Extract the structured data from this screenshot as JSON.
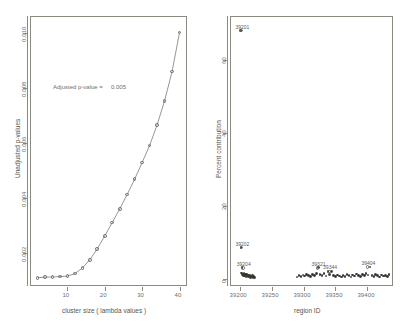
{
  "figure": {
    "panel_count": 2,
    "background": "#ffffff",
    "line_color": "#6a6a62",
    "marker_color": "#6a6a62",
    "point_color": "#2e2e2a"
  },
  "chart_data": [
    {
      "type": "line",
      "panel": "left",
      "title": "",
      "xlabel": "cluster size ( lambda values )",
      "ylabel": "Unadjusted p-values",
      "xlim": [
        0,
        42
      ],
      "ylim": [
        0.0008,
        0.0106
      ],
      "xticks": [
        10,
        20,
        30,
        40
      ],
      "xticklabels": [
        "10",
        "20",
        "30",
        "40"
      ],
      "yticks": [
        0.002,
        0.004,
        0.006,
        0.008,
        0.01
      ],
      "yticklabels": [
        "0.002",
        "0.004",
        "0.006",
        "0.008",
        "0.010"
      ],
      "grid": false,
      "legend": null,
      "marker": "open-circle",
      "annotations": [
        {
          "text": "Adjusted p-value =",
          "value": "0.005",
          "x": 13,
          "y": 0.0079
        }
      ],
      "x": [
        2,
        4,
        6,
        8,
        10,
        12,
        14,
        16,
        18,
        20,
        22,
        24,
        26,
        28,
        30,
        32,
        34,
        36,
        38,
        40
      ],
      "y": [
        0.0011,
        0.00112,
        0.00113,
        0.00114,
        0.00116,
        0.00125,
        0.00145,
        0.00175,
        0.00215,
        0.00262,
        0.0031,
        0.0036,
        0.00412,
        0.00468,
        0.00528,
        0.0059,
        0.00665,
        0.00752,
        0.00858,
        0.01
      ]
    },
    {
      "type": "scatter",
      "panel": "right",
      "title": "",
      "xlabel": "region ID",
      "ylabel": "Percent contribution",
      "xlim": [
        39185,
        39440
      ],
      "ylim": [
        -2,
        72
      ],
      "xticks": [
        39200,
        39250,
        39300,
        39350,
        39400
      ],
      "xticklabels": [
        "39200",
        "39250",
        "39300",
        "39350",
        "39400"
      ],
      "yticks": [
        0,
        20,
        40,
        60
      ],
      "yticklabels": [
        "0",
        "20",
        "40",
        "60"
      ],
      "grid": false,
      "legend": null,
      "marker": "filled-circle",
      "labeled_points": [
        {
          "label": "39201",
          "x": 39203,
          "y": 68.0
        },
        {
          "label": "39202",
          "x": 39203,
          "y": 8.5
        },
        {
          "label": "39204",
          "x": 39205,
          "y": 3.0
        },
        {
          "label": "39321",
          "x": 39322,
          "y": 3.0
        },
        {
          "label": "39344",
          "x": 39340,
          "y": 2.0
        },
        {
          "label": "39404",
          "x": 39400,
          "y": 3.2
        }
      ],
      "x": [
        39201,
        39202,
        39203,
        39204,
        39205,
        39206,
        39207,
        39208,
        39209,
        39210,
        39211,
        39212,
        39213,
        39214,
        39215,
        39216,
        39217,
        39218,
        39219,
        39220,
        39221,
        39222,
        39223,
        39290,
        39293,
        39296,
        39299,
        39302,
        39305,
        39308,
        39311,
        39314,
        39317,
        39320,
        39323,
        39326,
        39329,
        39332,
        39335,
        39338,
        39341,
        39344,
        39347,
        39350,
        39353,
        39356,
        39359,
        39362,
        39365,
        39368,
        39371,
        39374,
        39377,
        39380,
        39383,
        39386,
        39389,
        39392,
        39395,
        39398,
        39401,
        39404,
        39407,
        39410,
        39413,
        39416,
        39419,
        39422,
        39425,
        39428,
        39431,
        39434
      ],
      "y": [
        68.0,
        8.5,
        1.6,
        3.0,
        1.2,
        0.9,
        1.5,
        0.7,
        1.1,
        0.6,
        1.3,
        0.8,
        0.5,
        1.0,
        0.6,
        0.9,
        0.4,
        0.7,
        0.5,
        0.8,
        0.4,
        0.6,
        0.3,
        0.5,
        0.8,
        0.6,
        1.0,
        0.7,
        1.2,
        0.9,
        0.6,
        1.1,
        0.8,
        1.4,
        3.0,
        1.2,
        0.9,
        1.5,
        0.7,
        2.0,
        1.1,
        2.0,
        0.8,
        0.6,
        1.0,
        0.7,
        0.5,
        0.9,
        0.6,
        1.2,
        0.8,
        0.5,
        1.0,
        0.7,
        1.3,
        0.9,
        0.6,
        1.1,
        0.8,
        1.4,
        1.0,
        3.2,
        0.9,
        0.6,
        1.2,
        0.8,
        0.5,
        1.0,
        0.7,
        0.9,
        0.6,
        1.1
      ]
    }
  ]
}
